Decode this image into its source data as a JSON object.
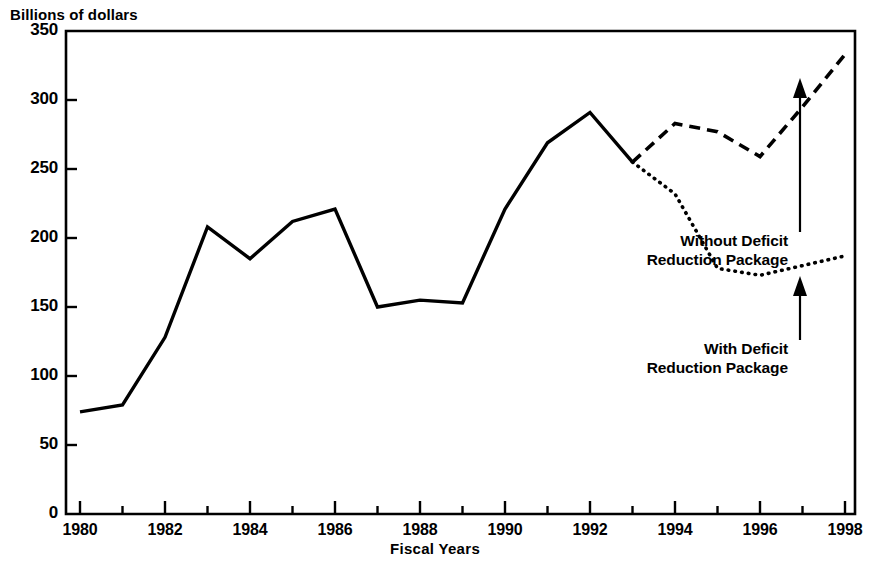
{
  "chart_data": {
    "type": "line",
    "title": "",
    "subtitle": "",
    "ylabel": "Billions of dollars",
    "xlabel": "Fiscal Years",
    "ylim": [
      0,
      350
    ],
    "xlim": [
      1980,
      1998
    ],
    "yticks": [
      0,
      50,
      100,
      150,
      200,
      250,
      300,
      350
    ],
    "ytick_labels": [
      "0",
      "50",
      "100",
      "150",
      "200",
      "250",
      "300",
      "350"
    ],
    "xticks": [
      1980,
      1982,
      1984,
      1986,
      1988,
      1990,
      1992,
      1994,
      1996,
      1998
    ],
    "xtick_labels": [
      "1980",
      "1982",
      "1984",
      "1986",
      "1988",
      "1990",
      "1992",
      "1994",
      "1996",
      "1998"
    ],
    "x_minor_ticks": [
      1981,
      1983,
      1985,
      1987,
      1989,
      1991,
      1993,
      1995,
      1997
    ],
    "grid": false,
    "legend_position": "inline-annotation",
    "series": [
      {
        "name": "Actual",
        "style": "solid",
        "color": "#000000",
        "x": [
          1980,
          1981,
          1982,
          1983,
          1984,
          1985,
          1986,
          1987,
          1988,
          1989,
          1990,
          1991,
          1992,
          1993
        ],
        "values": [
          74,
          79,
          128,
          208,
          185,
          212,
          221,
          150,
          155,
          153,
          221,
          269,
          291,
          255
        ]
      },
      {
        "name": "Without Deficit Reduction Package",
        "style": "dashed",
        "color": "#000000",
        "x": [
          1993,
          1994,
          1995,
          1996,
          1997,
          1998
        ],
        "values": [
          255,
          283,
          277,
          259,
          295,
          333
        ]
      },
      {
        "name": "With Deficit Reduction Package",
        "style": "dotted",
        "color": "#000000",
        "x": [
          1993,
          1994,
          1995,
          1996,
          1997,
          1998
        ],
        "values": [
          255,
          232,
          178,
          173,
          180,
          187
        ]
      }
    ],
    "annotations": [
      {
        "id": "without",
        "line1": "Without Deficit",
        "line2": "Reduction Package",
        "arrow": "up",
        "points_to_series": "Without Deficit Reduction Package"
      },
      {
        "id": "with",
        "line1": "With Deficit",
        "line2": "Reduction Package",
        "arrow": "up",
        "points_to_series": "With Deficit Reduction Package"
      }
    ]
  },
  "axes": {
    "y_title": "Billions of dollars",
    "x_title": "Fiscal Years"
  },
  "colors": {
    "ink": "#000000",
    "background": "#ffffff"
  }
}
